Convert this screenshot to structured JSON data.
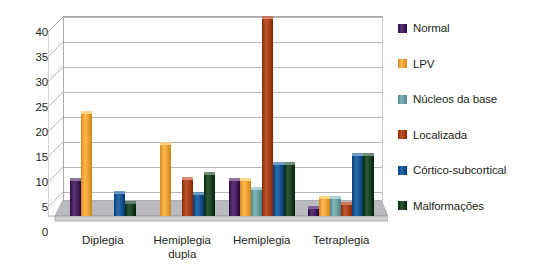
{
  "chart_data": {
    "type": "bar",
    "title": "",
    "subtitle": "",
    "xlabel": "",
    "ylabel": "",
    "ylim": [
      0,
      40
    ],
    "y_ticks": [
      0,
      5,
      10,
      15,
      20,
      25,
      30,
      35,
      40
    ],
    "grid": true,
    "legend_position": "right",
    "categories": [
      "Diplegia",
      "Hemiplegia dupla",
      "Hemiplegia",
      "Tetraplegia"
    ],
    "category_lines": [
      [
        "Diplegia"
      ],
      [
        "Hemiplegia",
        "dupla"
      ],
      [
        "Hemiplegia"
      ],
      [
        "Tetraplegia"
      ]
    ],
    "series": [
      {
        "name": "Normal",
        "color": "#4a2463",
        "values": [
          7.0,
          0,
          7.0,
          1.5
        ]
      },
      {
        "name": "LPV",
        "color": "#efa53a",
        "values": [
          20.5,
          14.2,
          7.0,
          3.5
        ]
      },
      {
        "name": "Núcleos da base",
        "color": "#6ea2a8",
        "values": [
          0,
          0,
          5.3,
          3.4
        ]
      },
      {
        "name": "Localizada",
        "color": "#ad4420",
        "values": [
          0,
          7.2,
          39.5,
          2.2
        ]
      },
      {
        "name": "Córtico-subcortical",
        "color": "#1b5a96",
        "values": [
          4.5,
          4.2,
          10.3,
          12.0
        ]
      },
      {
        "name": "Malformações",
        "color": "#1e4528",
        "values": [
          2.4,
          8.2,
          10.3,
          12.0
        ]
      }
    ]
  },
  "legend": {
    "items": [
      {
        "label": "Normal",
        "color": "#4a2463"
      },
      {
        "label": "LPV",
        "color": "#efa53a"
      },
      {
        "label": "Núcleos da base",
        "color": "#6ea2a8"
      },
      {
        "label": "Localizada",
        "color": "#ad4420"
      },
      {
        "label": "Córtico-subcortical",
        "color": "#1b5a96"
      },
      {
        "label": "Malformações",
        "color": "#1e4528"
      }
    ]
  },
  "colors": {
    "gridline": "#b6b7ba",
    "axis": "#a8a9ad",
    "floor": "#b9babd",
    "floor_front": "#cfd0d2",
    "text": "#231f20",
    "background": "#ffffff"
  }
}
